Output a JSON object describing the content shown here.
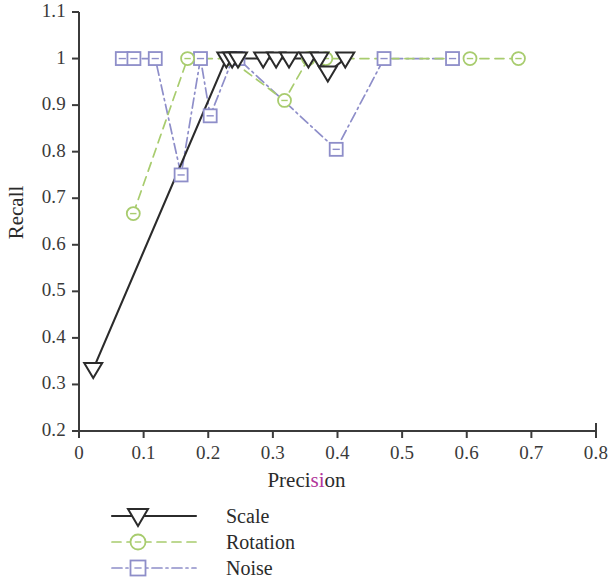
{
  "chart_data": {
    "type": "line",
    "title": "",
    "xlabel": "Precision",
    "ylabel": "Recall",
    "xlim": [
      0,
      0.8
    ],
    "ylim": [
      0.2,
      1.1
    ],
    "xticks": [
      "0",
      "0.1",
      "0.2",
      "0.3",
      "0.4",
      "0.5",
      "0.6",
      "0.7",
      "0.8"
    ],
    "xtick_values": [
      0,
      0.1,
      0.2,
      0.3,
      0.4,
      0.5,
      0.6,
      0.7,
      0.8
    ],
    "yticks": [
      "0.2",
      "0.3",
      "0.4",
      "0.5",
      "0.6",
      "0.7",
      "0.8",
      "0.9",
      "1",
      "1.1"
    ],
    "ytick_values": [
      0.2,
      0.3,
      0.4,
      0.5,
      0.6,
      0.7,
      0.8,
      0.9,
      1.0,
      1.1
    ],
    "grid": false,
    "legend_position": "below-plot-left",
    "series": [
      {
        "name": "Scale",
        "color": "#2b2b2b",
        "marker": "triangle-down",
        "linestyle": "solid",
        "x": [
          0.022,
          0.228,
          0.237,
          0.246,
          0.285,
          0.305,
          0.325,
          0.355,
          0.372,
          0.385,
          0.412
        ],
        "y": [
          0.333,
          1.0,
          1.0,
          1.0,
          1.0,
          1.0,
          1.0,
          1.0,
          1.0,
          0.97,
          1.0
        ]
      },
      {
        "name": "Rotation",
        "color": "#a8cc6e",
        "marker": "circle",
        "linestyle": "dashed",
        "x": [
          0.084,
          0.168,
          0.232,
          0.318,
          0.355,
          0.382,
          0.605,
          0.68
        ],
        "y": [
          0.667,
          1.0,
          1.0,
          0.91,
          1.0,
          1.0,
          1.0,
          1.0
        ]
      },
      {
        "name": "Noise",
        "color": "#8e8ec9",
        "marker": "square",
        "linestyle": "dashdot",
        "x": [
          0.067,
          0.085,
          0.118,
          0.158,
          0.188,
          0.203,
          0.238,
          0.246,
          0.398,
          0.472,
          0.578
        ],
        "y": [
          1.0,
          1.0,
          1.0,
          0.75,
          1.0,
          0.877,
          1.0,
          1.0,
          0.805,
          1.0,
          1.0
        ]
      }
    ]
  },
  "axes": {
    "x_title": "Precision",
    "x_title_tinted_part": "si",
    "y_title": "Recall"
  },
  "legend": {
    "items": [
      {
        "label": "Scale"
      },
      {
        "label": "Rotation"
      },
      {
        "label": "Noise"
      }
    ]
  }
}
